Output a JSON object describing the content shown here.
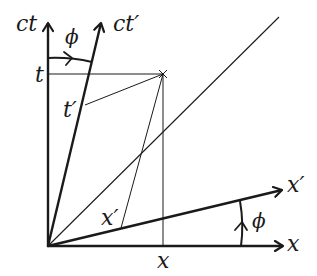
{
  "diagram": {
    "type": "Minkowski spacetime diagram",
    "colors": {
      "ink": "#1a1a1a",
      "background": "#ffffff"
    },
    "origin": [
      48,
      246
    ],
    "axes": {
      "ct": {
        "label": "ct",
        "tip": [
          48,
          22
        ]
      },
      "x": {
        "label": "x",
        "tip": [
          284,
          246
        ]
      },
      "ct_prime": {
        "label": "ct′",
        "tip": [
          101,
          22
        ]
      },
      "x_prime": {
        "label": "x′",
        "tip": [
          283,
          189
        ]
      }
    },
    "light_line": {
      "end": [
        279,
        17
      ]
    },
    "event_point": [
      163,
      74
    ],
    "labels": {
      "ct": "ct",
      "ct_prime": "ct′",
      "phi_top": "ϕ",
      "t": "t",
      "t_prime": "t′",
      "x_prime_axis": "x′",
      "phi_bottom": "ϕ",
      "x_axis": "x",
      "x_prime_proj": "x′",
      "x_proj": "x"
    }
  }
}
